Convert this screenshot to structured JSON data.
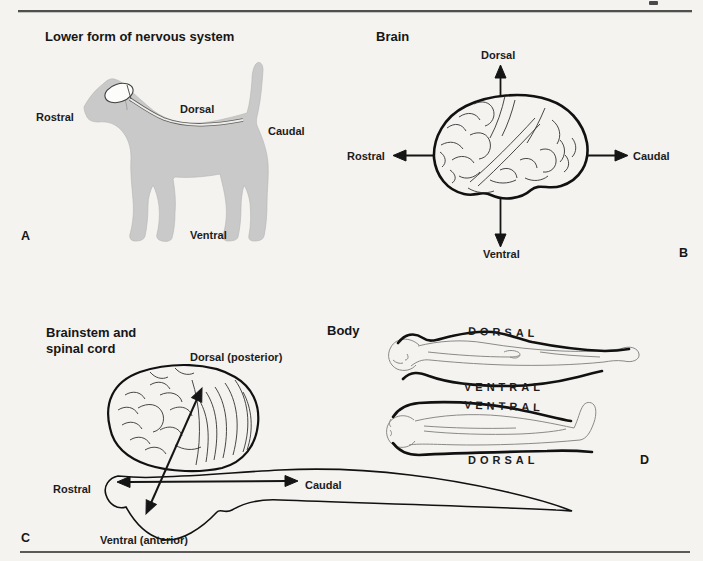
{
  "header": {
    "clipped_text": "CHAPTER 1 ■ ESSENTIAL CONCEPTS AND PRINCIPLES OF NEUROSCIENCE"
  },
  "panels": {
    "a": {
      "tag": "A",
      "title": "Lower form of nervous system",
      "labels": {
        "rostral": "Rostral",
        "dorsal": "Dorsal",
        "caudal": "Caudal",
        "ventral": "Ventral"
      }
    },
    "b": {
      "tag": "B",
      "title": "Brain",
      "labels": {
        "dorsal": "Dorsal",
        "ventral": "Ventral",
        "rostral": "Rostral",
        "caudal": "Caudal"
      }
    },
    "c": {
      "tag": "C",
      "title_line1": "Brainstem and",
      "title_line2": "spinal cord",
      "labels": {
        "dorsal": "Dorsal (posterior)",
        "ventral": "Ventral (anterior)",
        "rostral": "Rostral",
        "caudal": "Caudal"
      }
    },
    "d": {
      "tag": "D",
      "title": "Body",
      "prone_figure": {
        "top_label": "DORSAL",
        "bottom_label": "VENTRAL"
      },
      "supine_figure": {
        "top_label": "VENTRAL",
        "bottom_label": "DORSAL"
      }
    }
  },
  "colors": {
    "ink": "#1c1c1c",
    "dog_fill": "#c9c9c9",
    "background": "#f4f3f0"
  }
}
